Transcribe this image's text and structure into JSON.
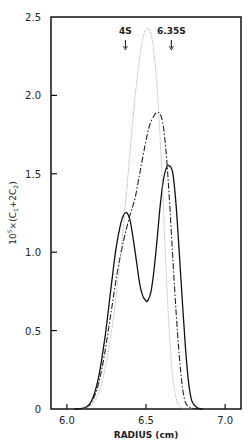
{
  "chart_data": {
    "type": "line",
    "title": "",
    "xlabel": "RADIUS (cm)",
    "ylabel": "10^5×(C1+2C2)",
    "xlim": [
      5.9,
      7.1
    ],
    "ylim": [
      0,
      2.5
    ],
    "xticks": [
      6.0,
      6.5,
      7.0
    ],
    "xtick_labels": [
      "6.0",
      "6.5",
      "7.0"
    ],
    "yticks": [
      0,
      0.5,
      1.0,
      1.5,
      2.0,
      2.5
    ],
    "ytick_labels": [
      "0",
      "0.5",
      "1.0",
      "1.5",
      "2.0",
      "2.5"
    ],
    "grid": false,
    "legend": null,
    "annotations": [
      {
        "text": "4S",
        "x": 6.37,
        "arrow": true
      },
      {
        "text": "6.35S",
        "x": 6.66,
        "arrow": true
      }
    ],
    "series": [
      {
        "name": "solid",
        "style": "solid",
        "x": [
          6.05,
          6.12,
          6.16,
          6.2,
          6.24,
          6.28,
          6.31,
          6.34,
          6.36,
          6.38,
          6.4,
          6.42,
          6.44,
          6.46,
          6.48,
          6.5,
          6.51,
          6.53,
          6.55,
          6.57,
          6.59,
          6.61,
          6.63,
          6.65,
          6.67,
          6.69,
          6.71,
          6.73,
          6.75,
          6.77,
          6.79,
          6.82,
          6.86
        ],
        "y": [
          0,
          0.01,
          0.06,
          0.2,
          0.45,
          0.78,
          1.02,
          1.18,
          1.24,
          1.25,
          1.2,
          1.08,
          0.94,
          0.8,
          0.72,
          0.69,
          0.69,
          0.74,
          0.88,
          1.08,
          1.3,
          1.46,
          1.54,
          1.55,
          1.5,
          1.3,
          1.0,
          0.68,
          0.38,
          0.16,
          0.05,
          0.01,
          0
        ]
      },
      {
        "name": "dash-dot",
        "style": "dashdot",
        "x": [
          6.05,
          6.12,
          6.16,
          6.2,
          6.24,
          6.28,
          6.32,
          6.36,
          6.4,
          6.43,
          6.46,
          6.49,
          6.52,
          6.55,
          6.57,
          6.59,
          6.61,
          6.63,
          6.65,
          6.67,
          6.69,
          6.71,
          6.73,
          6.75,
          6.78,
          6.82
        ],
        "y": [
          0,
          0.01,
          0.05,
          0.16,
          0.36,
          0.62,
          0.88,
          1.08,
          1.24,
          1.34,
          1.5,
          1.66,
          1.8,
          1.87,
          1.89,
          1.88,
          1.8,
          1.6,
          1.3,
          0.95,
          0.62,
          0.34,
          0.14,
          0.04,
          0.01,
          0
        ]
      },
      {
        "name": "dotted",
        "style": "dotted",
        "x": [
          6.1,
          6.16,
          6.2,
          6.24,
          6.28,
          6.32,
          6.36,
          6.4,
          6.43,
          6.46,
          6.48,
          6.5,
          6.52,
          6.54,
          6.56,
          6.58,
          6.6,
          6.62,
          6.64,
          6.66,
          6.68,
          6.7,
          6.72,
          6.75,
          6.8
        ],
        "y": [
          0,
          0.03,
          0.1,
          0.25,
          0.48,
          0.8,
          1.2,
          1.65,
          1.98,
          2.24,
          2.36,
          2.42,
          2.42,
          2.35,
          2.18,
          1.9,
          1.5,
          1.05,
          0.62,
          0.3,
          0.12,
          0.04,
          0.01,
          0,
          0
        ]
      }
    ]
  }
}
